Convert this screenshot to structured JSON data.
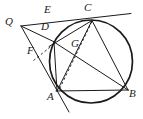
{
  "figure": {
    "kind": "plane-geometry-diagram",
    "width": 143,
    "height": 119,
    "background_color": "#ffffff",
    "stroke_color": "#1a1a1a",
    "label_color": "#1a1a1a"
  },
  "circle": {
    "name": "main-circle",
    "cx": 91,
    "cy": 61.5,
    "r": 41.5,
    "stroke_width": 1.6
  },
  "points": {
    "Q": {
      "label": "Q",
      "x": 21,
      "y": 26,
      "label_x": 5,
      "label_y": 17
    },
    "E": {
      "label": "E",
      "x": 55,
      "y": 20,
      "label_x": 44,
      "label_y": 5
    },
    "C": {
      "label": "C",
      "x": 92,
      "y": 20.5,
      "label_x": 84,
      "label_y": 3
    },
    "D": {
      "label": "D",
      "x": 54,
      "y": 42,
      "label_x": 41,
      "label_y": 21
    },
    "F": {
      "label": "F",
      "x": 38,
      "y": 58,
      "label_x": 28,
      "label_y": 45
    },
    "G": {
      "label": "G",
      "x": 76,
      "y": 50,
      "label_x": 71,
      "label_y": 38
    },
    "A": {
      "label": "A",
      "x": 57,
      "y": 91,
      "label_x": 47,
      "label_y": 92
    },
    "B": {
      "label": "B",
      "x": 128,
      "y": 90,
      "label_x": 129,
      "label_y": 89
    }
  },
  "segments": [
    {
      "name": "tangent-line-through-C",
      "from": "Q",
      "to": "tangent-end",
      "x1": 21,
      "y1": 26,
      "x2": 130,
      "y2": 14,
      "style": "solid"
    },
    {
      "name": "segment-Q-D",
      "from": "Q",
      "to": "D",
      "x1": 21,
      "y1": 26,
      "x2": 54,
      "y2": 42,
      "style": "solid"
    },
    {
      "name": "line-Q-through-A",
      "from": "Q",
      "to": "A-extended",
      "x1": 21,
      "y1": 26,
      "x2": 68,
      "y2": 111,
      "style": "solid"
    },
    {
      "name": "chord-C-D-extended",
      "from": "C",
      "to": "D-extended",
      "x1": 92,
      "y1": 20.5,
      "x2": 50,
      "y2": 46,
      "style": "solid"
    },
    {
      "name": "chord-C-A",
      "from": "C",
      "to": "A",
      "x1": 92,
      "y1": 20.5,
      "x2": 57,
      "y2": 91,
      "style": "solid"
    },
    {
      "name": "chord-C-B",
      "from": "C",
      "to": "B",
      "x1": 92,
      "y1": 20.5,
      "x2": 128,
      "y2": 90,
      "style": "solid"
    },
    {
      "name": "chord-A-B",
      "from": "A",
      "to": "B",
      "x1": 57,
      "y1": 91,
      "x2": 128,
      "y2": 90,
      "style": "solid"
    },
    {
      "name": "chord-D-B",
      "from": "D",
      "to": "B",
      "x1": 54,
      "y1": 42,
      "x2": 128,
      "y2": 90,
      "style": "solid"
    },
    {
      "name": "chord-D-A",
      "from": "D",
      "to": "A",
      "x1": 54,
      "y1": 42,
      "x2": 57,
      "y2": 91,
      "style": "solid"
    },
    {
      "name": "dashed-C-through-G-to-A",
      "from": "C",
      "to": "A",
      "x1": 92,
      "y1": 20.5,
      "x2": 60,
      "y2": 89,
      "style": "dashed"
    },
    {
      "name": "dashed-D-to-F",
      "from": "D",
      "to": "F",
      "x1": 54,
      "y1": 44,
      "x2": 34,
      "y2": 60,
      "style": "dashed"
    }
  ],
  "labels_order": [
    "Q",
    "E",
    "C",
    "D",
    "F",
    "G",
    "A",
    "B"
  ]
}
